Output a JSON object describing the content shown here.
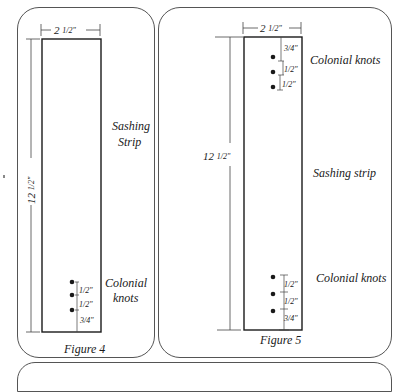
{
  "figures": [
    {
      "id": "figure-4",
      "caption": "Figure 4",
      "strip_label_line1": "Sashing",
      "strip_label_line2": "Strip",
      "width_label": "2 1/2\"",
      "width_whole": "2",
      "width_frac": "1/2\"",
      "height_label": "12 1/2\"",
      "height_whole": "12",
      "height_frac": "1/2\"",
      "knots_label_line1": "Colonial",
      "knots_label_line2": "knots",
      "knot_position": "bottom",
      "knot_spacings": [
        "1/2\"",
        "1/2\"",
        "3/4\""
      ]
    },
    {
      "id": "figure-5",
      "caption": "Figure 5",
      "strip_label": "Sashing strip",
      "width_label": "2 1/2\"",
      "width_whole": "2",
      "width_frac": "1/2\"",
      "height_label": "12 1/2\"",
      "height_whole": "12",
      "height_frac": "1/2\"",
      "top_knots_label": "Colonial knots",
      "top_knot_spacings": [
        "3/4\"",
        "1/2\"",
        "1/2\""
      ],
      "bottom_knots_label": "Colonial knots",
      "bottom_knot_spacings": [
        "1/2\"",
        "1/2\"",
        "3/4\""
      ]
    }
  ],
  "colors": {
    "line": "#1a1a1a",
    "dimension_line": "#444444",
    "panel_border": "#555555",
    "background": "#ffffff"
  }
}
